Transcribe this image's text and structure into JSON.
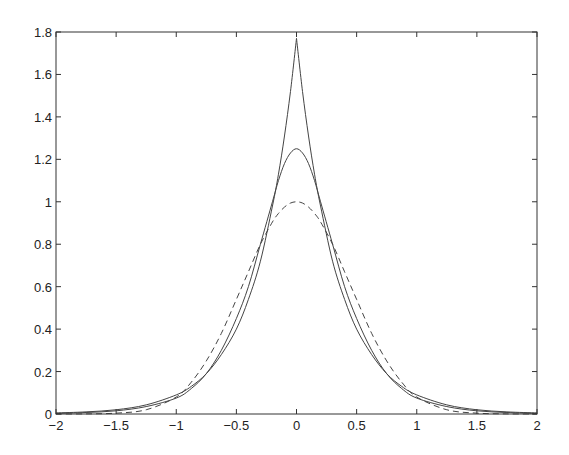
{
  "chart_data": {
    "type": "line",
    "title": "",
    "xlabel": "",
    "ylabel": "",
    "xlim": [
      -2,
      2
    ],
    "ylim": [
      0,
      1.8
    ],
    "grid": false,
    "legend": null,
    "x_ticks": [
      "-2",
      "-1.5",
      "-1",
      "-0.5",
      "0",
      "0.5",
      "1",
      "1.5",
      "2"
    ],
    "y_ticks": [
      "0",
      "0.2",
      "0.4",
      "0.6",
      "0.8",
      "1",
      "1.2",
      "1.4",
      "1.6",
      "1.8"
    ],
    "x": [
      -2,
      -1.75,
      -1.5,
      -1.25,
      -1,
      -0.875,
      -0.75,
      -0.625,
      -0.5,
      -0.4,
      -0.3,
      -0.2,
      -0.15,
      -0.1,
      -0.05,
      0,
      0.05,
      0.1,
      0.15,
      0.2,
      0.3,
      0.4,
      0.5,
      0.625,
      0.75,
      0.875,
      1,
      1.25,
      1.5,
      1.75,
      2
    ],
    "series": [
      {
        "name": "cusp peak (solid)",
        "style": "solid",
        "peak": 1.77,
        "values": [
          0.005,
          0.01,
          0.02,
          0.043,
          0.09,
          0.13,
          0.19,
          0.28,
          0.4,
          0.54,
          0.72,
          0.98,
          1.13,
          1.31,
          1.52,
          1.77,
          1.52,
          1.31,
          1.13,
          0.98,
          0.72,
          0.54,
          0.4,
          0.28,
          0.19,
          0.13,
          0.09,
          0.043,
          0.02,
          0.01,
          0.005
        ]
      },
      {
        "name": "smooth peak 1.25 (solid)",
        "style": "solid",
        "peak": 1.25,
        "values": [
          0.003,
          0.007,
          0.015,
          0.035,
          0.075,
          0.12,
          0.19,
          0.3,
          0.45,
          0.6,
          0.8,
          1.0,
          1.1,
          1.18,
          1.23,
          1.25,
          1.23,
          1.18,
          1.1,
          1.0,
          0.8,
          0.6,
          0.45,
          0.3,
          0.19,
          0.12,
          0.075,
          0.035,
          0.015,
          0.007,
          0.003
        ]
      },
      {
        "name": "gaussian peak 1 (dashed)",
        "style": "dashed",
        "peak": 1.0,
        "values": [
          0.0001,
          0.0005,
          0.004,
          0.02,
          0.08,
          0.15,
          0.25,
          0.38,
          0.54,
          0.67,
          0.8,
          0.905,
          0.945,
          0.975,
          0.994,
          1.0,
          0.994,
          0.975,
          0.945,
          0.905,
          0.8,
          0.67,
          0.54,
          0.38,
          0.25,
          0.15,
          0.08,
          0.02,
          0.004,
          0.0005,
          0.0001
        ]
      }
    ]
  },
  "axes": {
    "left_px": 56,
    "right_px": 537,
    "top_px": 32,
    "bottom_px": 414,
    "line_color": "#333333",
    "curve_color": "#444444"
  }
}
